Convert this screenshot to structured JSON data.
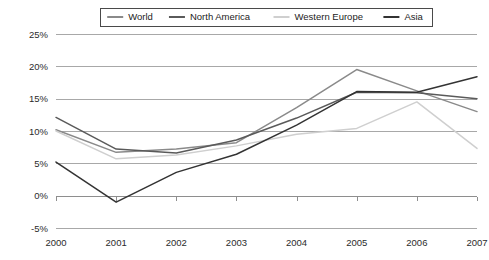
{
  "chart_data": {
    "type": "line",
    "title": "",
    "xlabel": "",
    "ylabel": "",
    "categories": [
      "2000",
      "2001",
      "2002",
      "2003",
      "2004",
      "2005",
      "2006",
      "2007"
    ],
    "x": [
      2000,
      2001,
      2002,
      2003,
      2004,
      2005,
      2006,
      2007
    ],
    "ylim": [
      -5,
      25
    ],
    "y_ticks": [
      -5,
      0,
      5,
      10,
      15,
      20,
      25
    ],
    "y_tick_labels": [
      "-5%",
      "0%",
      "5%",
      "10%",
      "15%",
      "20%",
      "25%"
    ],
    "y_unit": "%",
    "grid": true,
    "legend_position": "top-center",
    "series": [
      {
        "name": "World",
        "color": "#8a8a8a",
        "values": [
          10.2,
          6.7,
          7.2,
          8.2,
          13.6,
          19.5,
          16.2,
          13.0
        ]
      },
      {
        "name": "North America",
        "color": "#5a5a5a",
        "values": [
          12.1,
          7.2,
          6.6,
          8.6,
          12.0,
          16.0,
          15.9,
          15.0
        ]
      },
      {
        "name": "Western Europe",
        "color": "#cfcfcf",
        "values": [
          10.0,
          5.7,
          6.3,
          7.7,
          9.5,
          10.4,
          14.5,
          7.3
        ]
      },
      {
        "name": "Asia",
        "color": "#333333",
        "values": [
          5.2,
          -1.0,
          3.6,
          6.4,
          10.9,
          16.1,
          16.0,
          18.4
        ]
      }
    ]
  },
  "legend": {
    "entries": [
      {
        "label": "World"
      },
      {
        "label": "North America"
      },
      {
        "label": "Western Europe"
      },
      {
        "label": "Asia"
      }
    ]
  }
}
